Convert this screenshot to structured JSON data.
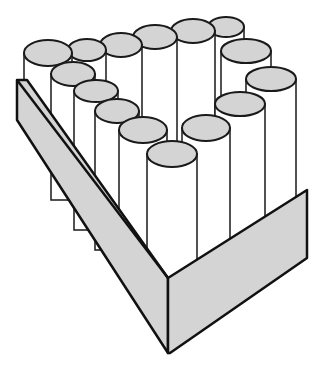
{
  "illustration": {
    "subject": "tray of cylinders",
    "colors": {
      "cap_fill": "#d4d4d4",
      "body_fill": "#ffffff",
      "wall_fill": "#d4d4d4",
      "stroke": "#1a1a1a"
    },
    "cylinders": [
      {
        "cx": 226,
        "cy": 27,
        "rx": 18,
        "ry": 10,
        "bottom": 120
      },
      {
        "cx": 193,
        "cy": 31,
        "rx": 22,
        "ry": 12,
        "bottom": 200
      },
      {
        "cx": 155,
        "cy": 37,
        "rx": 22,
        "ry": 12,
        "bottom": 200
      },
      {
        "cx": 121,
        "cy": 45,
        "rx": 21,
        "ry": 12,
        "bottom": 200
      },
      {
        "cx": 87,
        "cy": 50,
        "rx": 19,
        "ry": 11,
        "bottom": 200
      },
      {
        "cx": 48,
        "cy": 53,
        "rx": 24,
        "ry": 13,
        "bottom": 130
      },
      {
        "cx": 246,
        "cy": 51,
        "rx": 25,
        "ry": 12,
        "bottom": 200
      },
      {
        "cx": 73,
        "cy": 74,
        "rx": 22,
        "ry": 12,
        "bottom": 200
      },
      {
        "cx": 271,
        "cy": 79,
        "rx": 25,
        "ry": 12,
        "bottom": 220
      },
      {
        "cx": 96,
        "cy": 91,
        "rx": 22,
        "ry": 11,
        "bottom": 230
      },
      {
        "cx": 240,
        "cy": 104,
        "rx": 25,
        "ry": 12,
        "bottom": 250
      },
      {
        "cx": 117,
        "cy": 111,
        "rx": 22,
        "ry": 12,
        "bottom": 250
      },
      {
        "cx": 206,
        "cy": 128,
        "rx": 24,
        "ry": 13,
        "bottom": 270
      },
      {
        "cx": 143,
        "cy": 130,
        "rx": 24,
        "ry": 13,
        "bottom": 270
      },
      {
        "cx": 172,
        "cy": 154,
        "rx": 25,
        "ry": 13,
        "bottom": 290
      }
    ]
  }
}
